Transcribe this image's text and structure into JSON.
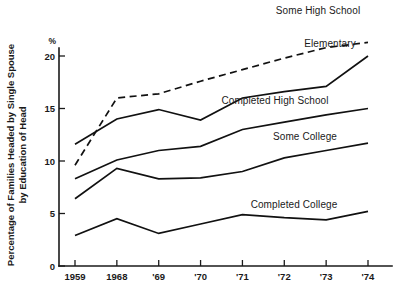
{
  "chart_data": {
    "type": "line",
    "title": "",
    "ylabel": "Percentage of Families Headed by Single Spouse by Education of Head",
    "ylabel_line1": "Percentage of Families Headed by Single Spouse",
    "ylabel_line2": "by Education of Head",
    "xlabel": "",
    "unit_label": "%",
    "x": [
      "1959",
      "1968",
      "'69",
      "'70",
      "'71",
      "'72",
      "'73",
      "'74"
    ],
    "categories": [
      "1959",
      "1968",
      "'69",
      "'70",
      "'71",
      "'72",
      "'73",
      "'74"
    ],
    "xtick_labels": [
      "1959",
      "1968",
      "'69",
      "'70",
      "'71",
      "'72",
      "'73",
      "'74"
    ],
    "ytick_labels": [
      "0",
      "5",
      "10",
      "15",
      "20"
    ],
    "ytick_values": [
      0,
      5,
      10,
      15,
      20
    ],
    "ylim": [
      0,
      21.5
    ],
    "grid": false,
    "legend_position": "inline-right-of-series",
    "series": [
      {
        "name": "Some High School",
        "style": "dashed",
        "label_x": 318,
        "label_y": 14,
        "values": [
          9.6,
          16.0,
          16.4,
          17.6,
          18.7,
          19.8,
          20.8,
          21.3
        ]
      },
      {
        "name": "Elementary",
        "style": "solid",
        "label_x": 330,
        "label_y": 47,
        "values": [
          11.6,
          14.0,
          14.9,
          13.9,
          16.0,
          16.6,
          17.1,
          20.0
        ]
      },
      {
        "name": "Completed High School",
        "style": "solid",
        "label_x": 275,
        "label_y": 104,
        "values": [
          8.3,
          10.1,
          11.0,
          11.4,
          13.0,
          13.7,
          14.4,
          15.0
        ]
      },
      {
        "name": "Some College",
        "style": "solid",
        "label_x": 305,
        "label_y": 140,
        "values": [
          6.4,
          9.3,
          8.3,
          8.4,
          9.0,
          10.3,
          11.0,
          11.7
        ]
      },
      {
        "name": "Completed College",
        "style": "solid",
        "label_x": 294,
        "label_y": 208,
        "values": [
          2.9,
          4.5,
          3.1,
          4.0,
          4.9,
          4.6,
          4.4,
          5.2
        ]
      }
    ]
  },
  "colors": {
    "ink": "#111111",
    "background": "#ffffff"
  }
}
